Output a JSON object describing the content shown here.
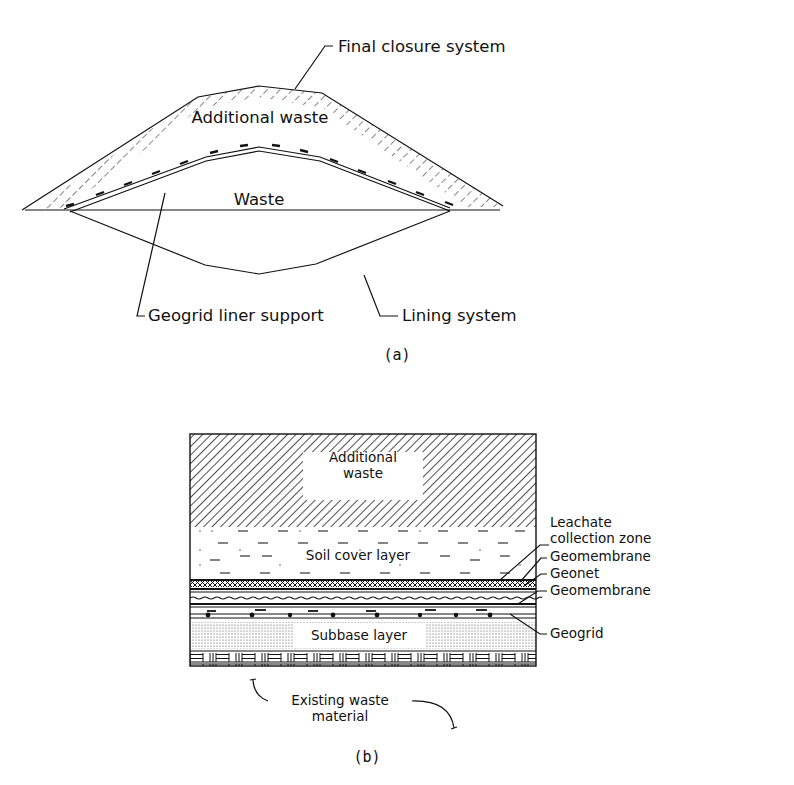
{
  "figure_a": {
    "caption": "(a)",
    "regions": {
      "additional_waste": "Additional waste",
      "waste": "Waste"
    },
    "callouts": {
      "final_closure": "Final closure system",
      "geogrid_liner": "Geogrid liner support",
      "lining_system": "Lining system"
    }
  },
  "figure_b": {
    "caption": "(b)",
    "layers": {
      "additional_waste_line1": "Additional",
      "additional_waste_line2": "waste",
      "soil_cover": "Soil cover layer",
      "subbase": "Subbase layer"
    },
    "callouts": {
      "leachate_line1": "Leachate",
      "leachate_line2": "collection zone",
      "geomembrane_top": "Geomembrane",
      "geonet": "Geonet",
      "geomembrane_bottom": "Geomembrane",
      "geogrid": "Geogrid"
    },
    "existing_waste_line1": "Existing waste",
    "existing_waste_line2": "material"
  }
}
